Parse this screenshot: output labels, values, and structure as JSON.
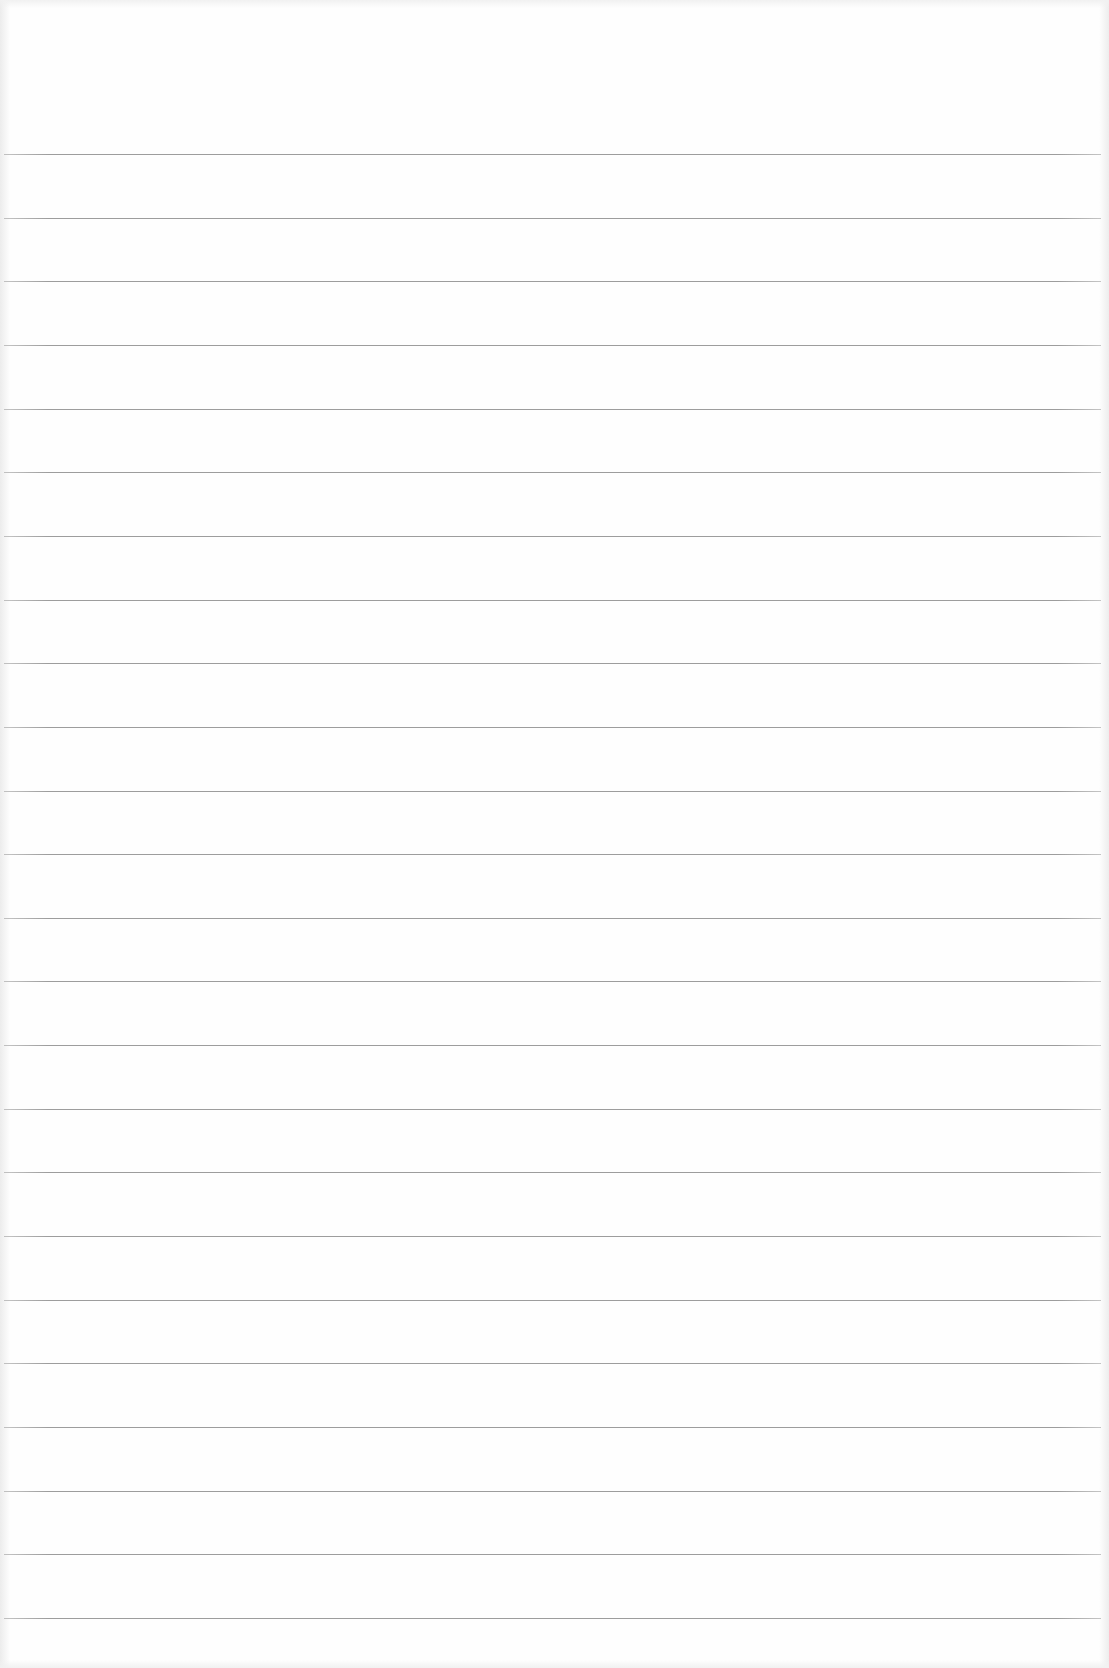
{
  "document": {
    "type": "lined-paper",
    "paper_color": "#fefefe",
    "rule_color": "#8c8c8c",
    "rule_count": 24,
    "rule_spacing_px": 63.65,
    "first_rule_y": 154,
    "last_rule_y": 1618,
    "rule_left_x": 4,
    "rule_right_x": 1101,
    "text_content": ""
  }
}
